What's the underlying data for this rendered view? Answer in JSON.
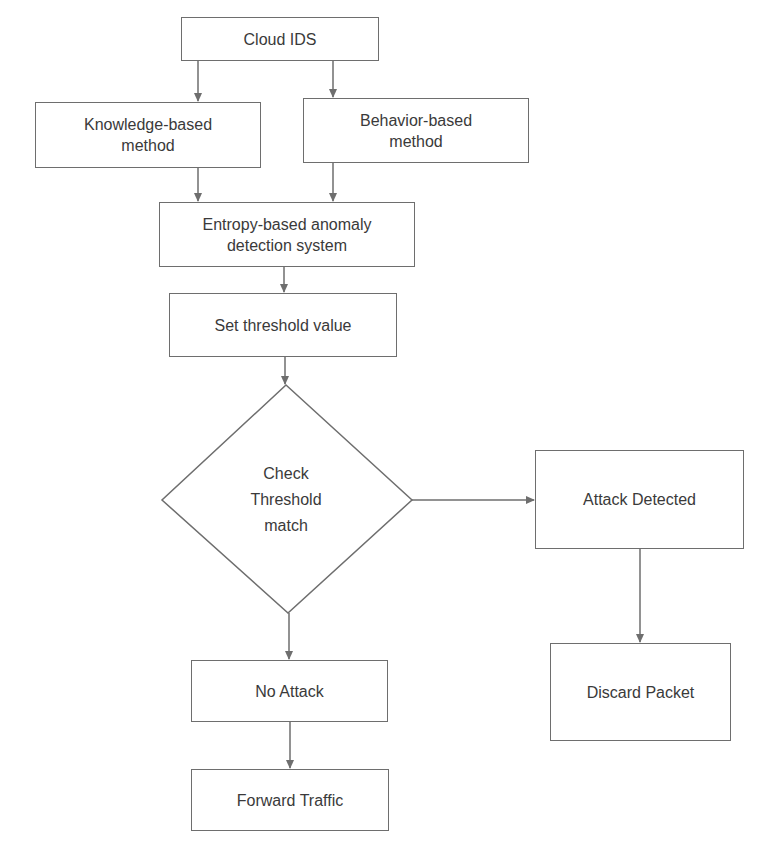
{
  "diagram": {
    "type": "flowchart",
    "line_color": "#6e6e6e",
    "text_color": "#3a3a3a",
    "background": "#ffffff",
    "nodes": {
      "cloud_ids": {
        "label": "Cloud IDS"
      },
      "knowledge": {
        "line1": "Knowledge-based",
        "line2": "method"
      },
      "behavior": {
        "line1": "Behavior-based",
        "line2": "method"
      },
      "entropy": {
        "line1": "Entropy-based anomaly",
        "line2": "detection system"
      },
      "threshold": {
        "label": "Set threshold value"
      },
      "check": {
        "line1": "Check",
        "line2": "Threshold",
        "line3": "match"
      },
      "attack_detected": {
        "label": "Attack Detected"
      },
      "discard": {
        "label": "Discard Packet"
      },
      "no_attack": {
        "label": "No Attack"
      },
      "forward": {
        "label": "Forward Traffic"
      }
    },
    "edges": [
      {
        "from": "Cloud IDS",
        "to": "Knowledge-based method"
      },
      {
        "from": "Cloud IDS",
        "to": "Behavior-based method"
      },
      {
        "from": "Knowledge-based method",
        "to": "Entropy-based anomaly detection system"
      },
      {
        "from": "Behavior-based method",
        "to": "Entropy-based anomaly detection system"
      },
      {
        "from": "Entropy-based anomaly detection system",
        "to": "Set threshold value"
      },
      {
        "from": "Set threshold value",
        "to": "Check Threshold match"
      },
      {
        "from": "Check Threshold match",
        "to": "Attack Detected"
      },
      {
        "from": "Attack Detected",
        "to": "Discard Packet"
      },
      {
        "from": "Check Threshold match",
        "to": "No Attack"
      },
      {
        "from": "No Attack",
        "to": "Forward Traffic"
      }
    ]
  }
}
